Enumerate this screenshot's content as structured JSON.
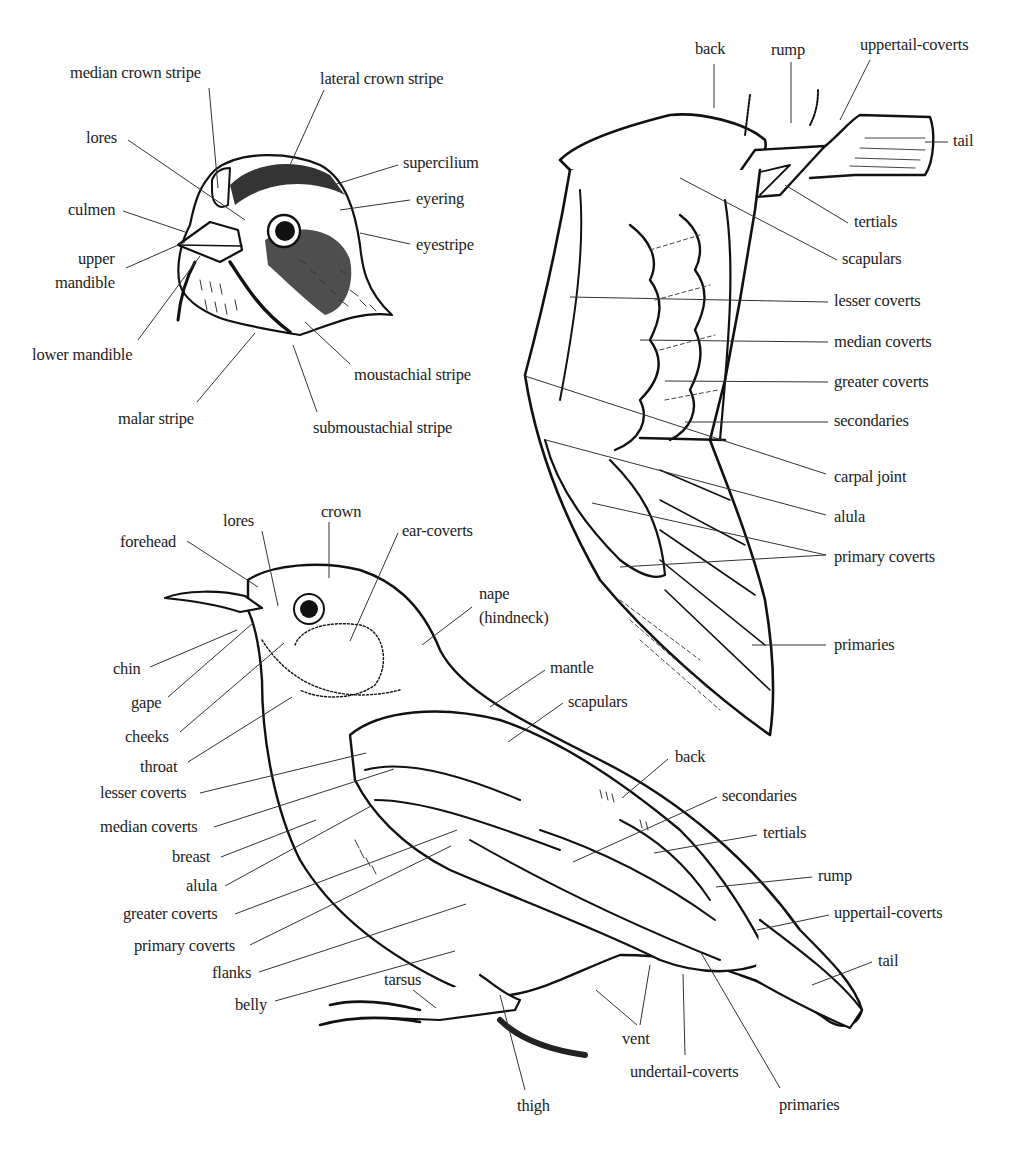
{
  "colors": {
    "ink": "#111111",
    "leader": "#333333",
    "background": "#ffffff"
  },
  "head_figure": {
    "labels": [
      {
        "id": "median-crown-stripe",
        "text": "median crown stripe",
        "x": 70,
        "y": 64
      },
      {
        "id": "lateral-crown-stripe",
        "text": "lateral crown stripe",
        "x": 320,
        "y": 70
      },
      {
        "id": "lores",
        "text": "lores",
        "x": 86,
        "y": 129
      },
      {
        "id": "supercilium",
        "text": "supercilium",
        "x": 403,
        "y": 154
      },
      {
        "id": "eyering",
        "text": "eyering",
        "x": 416,
        "y": 190
      },
      {
        "id": "culmen",
        "text": "culmen",
        "x": 68,
        "y": 201
      },
      {
        "id": "eyestripe",
        "text": "eyestripe",
        "x": 416,
        "y": 236
      },
      {
        "id": "upper-mandible-1",
        "text": "upper",
        "x": 78,
        "y": 250
      },
      {
        "id": "upper-mandible-2",
        "text": "mandible",
        "x": 55,
        "y": 274
      },
      {
        "id": "lower-mandible",
        "text": "lower mandible",
        "x": 32,
        "y": 346
      },
      {
        "id": "moustachial-stripe",
        "text": "moustachial stripe",
        "x": 354,
        "y": 366
      },
      {
        "id": "malar-stripe",
        "text": "malar stripe",
        "x": 118,
        "y": 410
      },
      {
        "id": "submoustachial-stripe",
        "text": "submoustachial stripe",
        "x": 313,
        "y": 419
      }
    ]
  },
  "wing_figure": {
    "labels": [
      {
        "id": "back",
        "text": "back",
        "x": 695,
        "y": 40
      },
      {
        "id": "rump",
        "text": "rump",
        "x": 771,
        "y": 41
      },
      {
        "id": "uppertail-coverts",
        "text": "uppertail-coverts",
        "x": 860,
        "y": 36
      },
      {
        "id": "tail",
        "text": "tail",
        "x": 953,
        "y": 132
      },
      {
        "id": "tertials",
        "text": "tertials",
        "x": 854,
        "y": 213
      },
      {
        "id": "scapulars",
        "text": "scapulars",
        "x": 842,
        "y": 250
      },
      {
        "id": "lesser-coverts",
        "text": "lesser coverts",
        "x": 834,
        "y": 292
      },
      {
        "id": "median-coverts",
        "text": "median coverts",
        "x": 834,
        "y": 333
      },
      {
        "id": "greater-coverts",
        "text": "greater coverts",
        "x": 834,
        "y": 373
      },
      {
        "id": "secondaries",
        "text": "secondaries",
        "x": 834,
        "y": 412
      },
      {
        "id": "carpal-joint",
        "text": "carpal joint",
        "x": 834,
        "y": 468
      },
      {
        "id": "alula",
        "text": "alula",
        "x": 834,
        "y": 508
      },
      {
        "id": "primary-coverts",
        "text": "primary coverts",
        "x": 834,
        "y": 548
      },
      {
        "id": "primaries",
        "text": "primaries",
        "x": 834,
        "y": 636
      }
    ]
  },
  "body_figure": {
    "labels": [
      {
        "id": "lores",
        "text": "lores",
        "x": 223,
        "y": 512
      },
      {
        "id": "crown",
        "text": "crown",
        "x": 321,
        "y": 503
      },
      {
        "id": "ear-coverts",
        "text": "ear-coverts",
        "x": 402,
        "y": 522
      },
      {
        "id": "forehead",
        "text": "forehead",
        "x": 120,
        "y": 533
      },
      {
        "id": "nape",
        "text": "nape",
        "x": 479,
        "y": 585
      },
      {
        "id": "hindneck",
        "text": "(hindneck)",
        "x": 479,
        "y": 609
      },
      {
        "id": "chin",
        "text": "chin",
        "x": 113,
        "y": 660
      },
      {
        "id": "mantle",
        "text": "mantle",
        "x": 550,
        "y": 659
      },
      {
        "id": "gape",
        "text": "gape",
        "x": 131,
        "y": 694
      },
      {
        "id": "scapulars",
        "text": "scapulars",
        "x": 568,
        "y": 693
      },
      {
        "id": "cheeks",
        "text": "cheeks",
        "x": 125,
        "y": 728
      },
      {
        "id": "throat",
        "text": "throat",
        "x": 140,
        "y": 758
      },
      {
        "id": "back",
        "text": "back",
        "x": 675,
        "y": 748
      },
      {
        "id": "lesser-coverts",
        "text": "lesser coverts",
        "x": 100,
        "y": 784
      },
      {
        "id": "secondaries",
        "text": "secondaries",
        "x": 722,
        "y": 787
      },
      {
        "id": "median-coverts",
        "text": "median coverts",
        "x": 100,
        "y": 818
      },
      {
        "id": "tertials",
        "text": "tertials",
        "x": 763,
        "y": 824
      },
      {
        "id": "breast",
        "text": "breast",
        "x": 172,
        "y": 848
      },
      {
        "id": "rump",
        "text": "rump",
        "x": 818,
        "y": 867
      },
      {
        "id": "alula",
        "text": "alula",
        "x": 186,
        "y": 877
      },
      {
        "id": "greater-coverts",
        "text": "greater coverts",
        "x": 123,
        "y": 905
      },
      {
        "id": "uppertail-coverts",
        "text": "uppertail-coverts",
        "x": 834,
        "y": 904
      },
      {
        "id": "primary-coverts",
        "text": "primary coverts",
        "x": 134,
        "y": 937
      },
      {
        "id": "tail",
        "text": "tail",
        "x": 878,
        "y": 952
      },
      {
        "id": "flanks",
        "text": "flanks",
        "x": 212,
        "y": 964
      },
      {
        "id": "tarsus",
        "text": "tarsus",
        "x": 384,
        "y": 971
      },
      {
        "id": "belly",
        "text": "belly",
        "x": 235,
        "y": 996
      },
      {
        "id": "vent",
        "text": "vent",
        "x": 622,
        "y": 1030
      },
      {
        "id": "undertail-coverts",
        "text": "undertail-coverts",
        "x": 630,
        "y": 1063
      },
      {
        "id": "thigh",
        "text": "thigh",
        "x": 517,
        "y": 1097
      },
      {
        "id": "primaries",
        "text": "primaries",
        "x": 779,
        "y": 1096
      }
    ]
  }
}
